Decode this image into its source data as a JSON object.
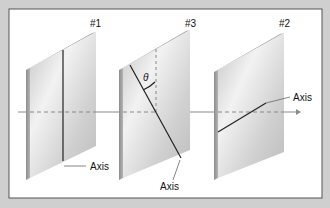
{
  "diagram": {
    "polarizers": [
      {
        "id": "p1",
        "label": "#1",
        "axis_label": "Axis",
        "axis": "vertical"
      },
      {
        "id": "p3",
        "label": "#3",
        "axis_label": "Axis",
        "axis": "tilted",
        "angle_symbol": "θ"
      },
      {
        "id": "p2",
        "label": "#2",
        "axis_label": "Axis",
        "axis": "horizontal"
      }
    ],
    "colors": {
      "background": "#cfcfcf",
      "panel": "#ffffff",
      "plate_face": "#d6d6d6",
      "plate_edge": "#9a9a9a",
      "line": "#222222",
      "beam": "#8a8a8a"
    }
  }
}
